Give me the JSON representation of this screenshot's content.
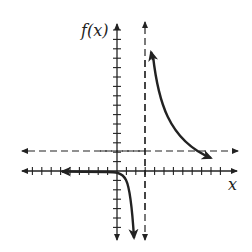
{
  "chart_data": {
    "type": "line",
    "title": "",
    "xlabel": "x",
    "ylabel": "f(x)",
    "grid": false,
    "legend": null,
    "xlim": [
      -10,
      11
    ],
    "ylim": [
      -7,
      13
    ],
    "x_ticks_step": 1,
    "y_ticks_step": 1,
    "asymptotes": {
      "vertical": {
        "x": 3,
        "style": "dashed"
      },
      "horizontal": {
        "y": 2,
        "style": "dashed"
      }
    },
    "series": [
      {
        "name": "left branch",
        "x": [
          -7,
          -5,
          -3,
          -1,
          0,
          1,
          1.5,
          2
        ],
        "y": [
          0,
          -0.05,
          -0.1,
          -0.3,
          -0.6,
          -1.5,
          -3,
          -7
        ]
      },
      {
        "name": "right branch",
        "x": [
          3.4,
          4,
          5,
          6,
          7,
          8,
          9,
          10
        ],
        "y": [
          11.5,
          8,
          5,
          3,
          1.9,
          1.4,
          1.2,
          1.1
        ]
      }
    ]
  },
  "labels": {
    "y_axis": "f(x)",
    "x_axis": "x"
  }
}
